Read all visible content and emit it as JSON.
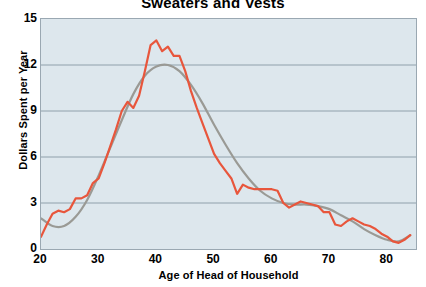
{
  "chart_data": {
    "type": "line",
    "title": "Sweaters and Vests",
    "xlabel": "Age of Head of Household",
    "ylabel": "Dollars Spent per Year",
    "xlim": [
      20,
      85
    ],
    "ylim": [
      0,
      15
    ],
    "xticks": [
      20,
      30,
      40,
      50,
      60,
      70,
      80
    ],
    "yticks": [
      0,
      3,
      6,
      9,
      12,
      15
    ],
    "grid": true,
    "legend": "none",
    "plot_background_color": "#dde7ed",
    "series": [
      {
        "name": "observed",
        "color": "#e8563c",
        "style": "jagged-line",
        "x": [
          20,
          21,
          22,
          23,
          24,
          25,
          26,
          27,
          28,
          29,
          30,
          31,
          32,
          33,
          34,
          35,
          36,
          37,
          38,
          39,
          40,
          41,
          42,
          43,
          44,
          45,
          46,
          47,
          48,
          49,
          50,
          51,
          52,
          53,
          54,
          55,
          56,
          57,
          58,
          59,
          60,
          61,
          62,
          63,
          64,
          65,
          66,
          67,
          68,
          69,
          70,
          71,
          72,
          73,
          74,
          75,
          76,
          77,
          78,
          79,
          80,
          81,
          82,
          83,
          84
        ],
        "values": [
          0.8,
          1.6,
          2.3,
          2.5,
          2.4,
          2.6,
          3.3,
          3.3,
          3.5,
          4.3,
          4.6,
          5.6,
          6.7,
          7.8,
          9.0,
          9.6,
          9.2,
          10.0,
          11.6,
          13.3,
          13.6,
          12.9,
          13.2,
          12.6,
          12.6,
          11.6,
          10.3,
          9.2,
          8.2,
          7.2,
          6.2,
          5.6,
          5.1,
          4.6,
          3.6,
          4.2,
          4.0,
          3.9,
          3.9,
          3.9,
          3.9,
          3.8,
          3.0,
          2.7,
          2.9,
          3.1,
          3.0,
          2.9,
          2.8,
          2.4,
          2.4,
          1.6,
          1.5,
          1.8,
          2.0,
          1.8,
          1.6,
          1.5,
          1.3,
          1.0,
          0.8,
          0.5,
          0.4,
          0.6,
          0.9
        ]
      },
      {
        "name": "fitted",
        "color": "#9a9a95",
        "style": "smooth-curve",
        "x": [
          20,
          22,
          24,
          26,
          28,
          30,
          32,
          34,
          36,
          38,
          40,
          42,
          44,
          46,
          48,
          50,
          52,
          54,
          56,
          58,
          60,
          62,
          64,
          66,
          68,
          70,
          72,
          74,
          76,
          78,
          80,
          82,
          84
        ],
        "values": [
          2.0,
          1.5,
          1.5,
          2.1,
          3.2,
          4.8,
          6.6,
          8.4,
          10.1,
          11.3,
          11.9,
          12.0,
          11.6,
          10.7,
          9.5,
          8.1,
          6.8,
          5.6,
          4.6,
          3.8,
          3.3,
          3.0,
          2.9,
          2.9,
          2.8,
          2.6,
          2.2,
          1.8,
          1.3,
          0.9,
          0.6,
          0.5,
          0.9
        ]
      }
    ]
  }
}
